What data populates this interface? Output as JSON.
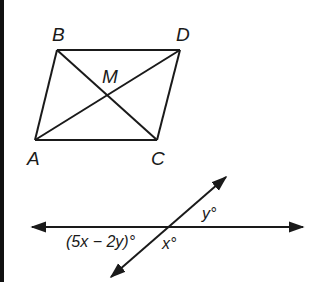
{
  "figure_1": {
    "type": "parallelogram-with-diagonals",
    "vertices": {
      "A": {
        "label": "A",
        "x": 35,
        "y": 140
      },
      "B": {
        "label": "B",
        "x": 57,
        "y": 50
      },
      "C": {
        "label": "C",
        "x": 157,
        "y": 140
      },
      "D": {
        "label": "D",
        "x": 180,
        "y": 50
      }
    },
    "intersection": {
      "label": "M",
      "x": 107,
      "y": 95
    },
    "segments": [
      "AB",
      "BD",
      "DC",
      "CA",
      "AD",
      "BC"
    ]
  },
  "figure_2": {
    "type": "intersecting-lines",
    "horizontal_line": {
      "from": [
        30,
        227
      ],
      "to": [
        305,
        227
      ],
      "arrows": "both"
    },
    "transversal": {
      "from": [
        110,
        278
      ],
      "to": [
        227,
        176
      ],
      "arrows": "both"
    },
    "angle_labels": {
      "left_lower": "(5x − 2y)°",
      "right_upper": "y°",
      "bottom": "x°"
    }
  },
  "colors": {
    "stroke": "#1a1a1a",
    "background": "#ffffff",
    "border": "#111111"
  }
}
